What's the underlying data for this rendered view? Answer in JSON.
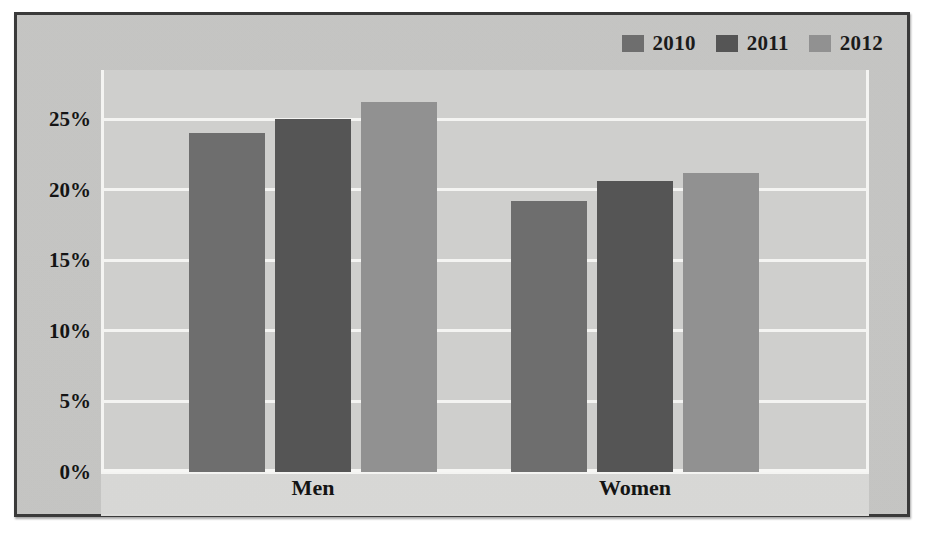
{
  "chart_data": {
    "type": "bar",
    "title": "",
    "subtitle": "",
    "xlabel": "",
    "ylabel": "",
    "categories": [
      "Men",
      "Women"
    ],
    "series": [
      {
        "name": "2010",
        "values": [
          24.0,
          19.2
        ],
        "color": "#6e6e6e"
      },
      {
        "name": "2011",
        "values": [
          25.0,
          20.6
        ],
        "color": "#555555"
      },
      {
        "name": "2012",
        "values": [
          26.2,
          21.2
        ],
        "color": "#919191"
      }
    ],
    "ylim": [
      0,
      28.5
    ],
    "ytick_values": [
      0,
      5,
      10,
      15,
      20,
      25
    ],
    "ytick_labels": [
      "0%",
      "5%",
      "10%",
      "15%",
      "20%",
      "25%"
    ],
    "grid": true,
    "grid_color": "#f4f4f2",
    "legend_position": "top-right",
    "value_suffix": "%"
  },
  "legend": {
    "items": [
      {
        "label": "2010",
        "color": "#6e6e6e"
      },
      {
        "label": "2011",
        "color": "#555555"
      },
      {
        "label": "2012",
        "color": "#919191"
      }
    ]
  },
  "axes": {
    "y_ticks": [
      {
        "label": "0%",
        "value": 0
      },
      {
        "label": "5%",
        "value": 5
      },
      {
        "label": "10%",
        "value": 10
      },
      {
        "label": "15%",
        "value": 15
      },
      {
        "label": "20%",
        "value": 20
      },
      {
        "label": "25%",
        "value": 25
      }
    ],
    "x_ticks": [
      {
        "label": "Men"
      },
      {
        "label": "Women"
      }
    ]
  },
  "colors": {
    "figure_background": "#c8c8c6",
    "plot_background": "#cfcfcd",
    "frame_border": "#3a3a3a",
    "gridline": "#f4f4f2",
    "text": "#141414"
  }
}
